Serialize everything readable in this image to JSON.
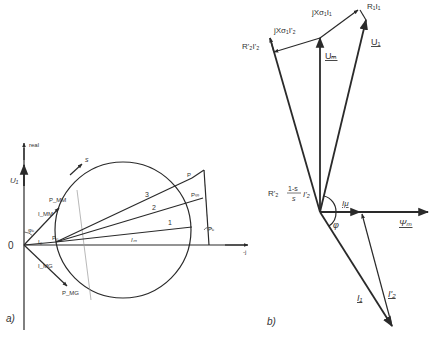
{
  "diagram_a": {
    "panel_label": "a)",
    "axis_vertical_label": "real",
    "voltage_label": "U₁",
    "origin_label": "0",
    "axis_horizontal_label": "-j",
    "slip_direction_label": "s",
    "angle_label": "φₖ",
    "points": {
      "p0": "P₀",
      "pinf": "P∞",
      "pmm": "P_MM",
      "pmg": "P_MG",
      "pk": "Pₖ",
      "p": "P"
    },
    "currents": {
      "i_mm": "I_MM",
      "i_mg": "I_MG",
      "i_0": "I₀",
      "i_m": "Iₘ"
    },
    "line_labels": [
      "1",
      "2",
      "3"
    ]
  },
  "diagram_b": {
    "panel_label": "b)",
    "labels": {
      "u1": "U₁",
      "um": "Uₘ",
      "r1i1": "R₁I₁",
      "jx1i1": "jXσ₁I₁",
      "jx2i2": "jXσ₁I'₂",
      "r2i2": "R'₂I'₂",
      "r2slip_prefix": "R'₂",
      "r2slip_num": "1-s",
      "r2slip_den": "s",
      "r2slip_suffix": "I'₂",
      "imu": "Iμ",
      "psi": "Ψₘ",
      "phi": "φ",
      "i1": "I₁",
      "i2": "I'₂"
    }
  }
}
